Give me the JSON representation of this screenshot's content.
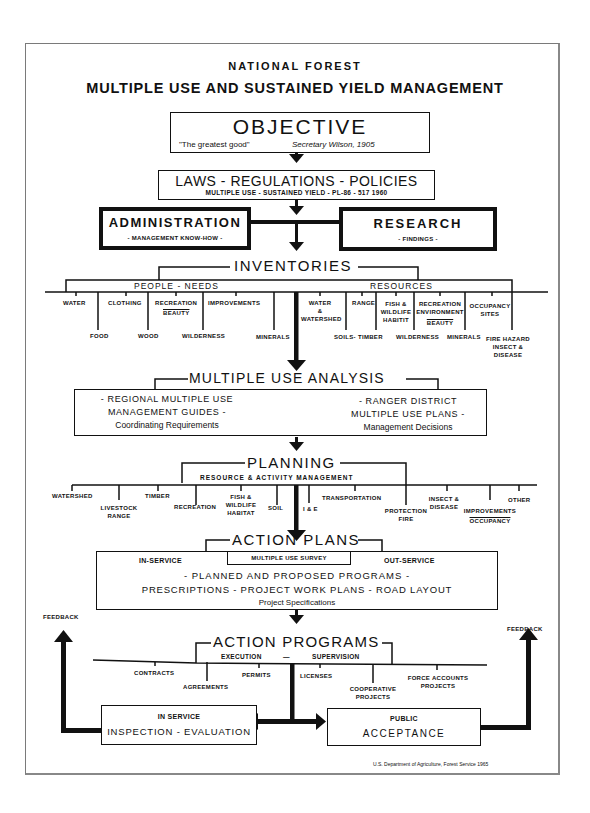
{
  "header": {
    "supertitle": "NATIONAL FOREST",
    "title": "MULTIPLE USE AND SUSTAINED YIELD MANAGEMENT"
  },
  "objective": {
    "title": "OBJECTIVE",
    "quote": "\"The greatest good\"",
    "attribution": "Secretary Wilson, 1905"
  },
  "laws": {
    "title": "LAWS - REGULATIONS - POLICIES",
    "subtitle": "MULTIPLE USE - SUSTAINED YIELD - PL-86 - 517 1960"
  },
  "administration": {
    "title": "ADMINISTRATION",
    "subtitle": "- MANAGEMENT KNOW-HOW -"
  },
  "research": {
    "title": "RESEARCH",
    "subtitle": "- FINDINGS -"
  },
  "inventories": {
    "title": "INVENTORIES",
    "people_needs": {
      "label": "PEOPLE - NEEDS",
      "items": [
        "WATER",
        "FOOD",
        "CLOTHING",
        "WOOD",
        "RECREATION",
        "BEAUTY",
        "WILDERNESS",
        "IMPROVEMENTS",
        "MINERALS"
      ]
    },
    "resources": {
      "label": "RESOURCES",
      "items": [
        "WATER",
        "&",
        "WATERSHED",
        "SOILS-",
        "RANGE",
        "TIMBER",
        "FISH &",
        "WILDLIFE",
        "HABITIT",
        "WILDERNESS",
        "RECREATION",
        "ENVIRONMENT",
        "BEAUTY",
        "MINERALS",
        "OCCUPANCY",
        "SITES",
        "FIRE HAZARD",
        "INSECT &",
        "DISEASE"
      ]
    }
  },
  "analysis": {
    "title": "MULTIPLE USE ANALYSIS",
    "left": [
      "- REGIONAL MULTIPLE USE",
      "MANAGEMENT GUIDES -",
      "Coordinating Requirements"
    ],
    "right": [
      "- RANGER DISTRICT",
      "MULTIPLE USE PLANS -",
      "Management Decisions"
    ]
  },
  "planning": {
    "title": "PLANNING",
    "subtitle": "RESOURCE & ACTIVITY MANAGEMENT",
    "items": [
      "WATERSHED",
      "LIVESTOCK",
      "RANGE",
      "TIMBER",
      "RECREATION",
      "FISH &",
      "WILDLIFE",
      "HABITAT",
      "SOIL",
      "I & E",
      "TRANSPORTATION",
      "PROTECTION",
      "FIRE",
      "INSECT &",
      "DISEASE",
      "IMPROVEMENTS",
      "OCCUPANCY",
      "OTHER"
    ]
  },
  "action_plans": {
    "title": "ACTION PLANS",
    "in_service": "IN-SERVICE",
    "survey": "MULTIPLE USE SURVEY",
    "out_service": "OUT-SERVICE",
    "line1": "- PLANNED AND PROPOSED PROGRAMS -",
    "line2": "PRESCRIPTIONS - PROJECT WORK PLANS - ROAD LAYOUT",
    "line3": "Project Specifications"
  },
  "action_programs": {
    "title": "ACTION PROGRAMS",
    "execution": "EXECUTION",
    "dash": "—",
    "supervision": "SUPERVISION",
    "items": [
      "CONTRACTS",
      "AGREEMENTS",
      "PERMITS",
      "LICENSES",
      "COOPERATIVE",
      "PROJECTS",
      "FORCE ACCOUNTS",
      "PROJECTS"
    ]
  },
  "inspection": {
    "line1": "IN SERVICE",
    "line2": "INSPECTION - EVALUATION"
  },
  "acceptance": {
    "line1": "PUBLIC",
    "line2": "ACCEPTANCE"
  },
  "feedback": {
    "left": "FEEDBACK",
    "right": "FEEDBACK"
  },
  "footer": {
    "credit": "U.S. Department of Agriculture, Forest Service   1965"
  }
}
